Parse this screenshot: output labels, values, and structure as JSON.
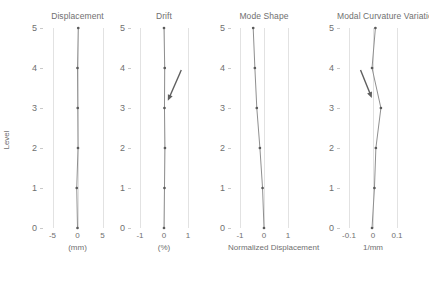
{
  "figure": {
    "ylabel": "Level",
    "y_ticks": [
      "5",
      "4",
      "3",
      "2",
      "1",
      "0"
    ]
  },
  "chart_data": {
    "type": "line",
    "title": "",
    "ylabel": "Level",
    "ylim": [
      0,
      5
    ],
    "y_ticks": [
      5,
      4,
      3,
      2,
      1,
      0
    ],
    "grid": true,
    "legend": "none",
    "orientation": "vertical-profile",
    "panels": [
      {
        "title": "Displacement",
        "xlabel": "(mm)",
        "xlim": [
          -7.5,
          7.5
        ],
        "x_ticks": [
          -5,
          0,
          5
        ],
        "x_tick_labels": [
          "-5",
          "0",
          "5"
        ],
        "series": [
          {
            "name": "Displacement",
            "y": [
              0,
              1,
              2,
              3,
              4,
              5
            ],
            "values": [
              0.0,
              -0.15,
              0.1,
              0.05,
              0.0,
              0.15
            ]
          }
        ],
        "annotations": []
      },
      {
        "title": "Drift",
        "xlabel": "(%)",
        "xlim": [
          -1.5,
          1.5
        ],
        "x_ticks": [
          -1,
          0,
          1
        ],
        "x_tick_labels": [
          "-1",
          "0",
          "1"
        ],
        "series": [
          {
            "name": "Drift",
            "y": [
              0,
              1,
              2,
              3,
              4,
              5
            ],
            "values": [
              0.0,
              0.02,
              0.04,
              0.02,
              0.03,
              0.0
            ]
          }
        ],
        "annotations": [
          {
            "type": "arrow",
            "label": "",
            "from": [
              0.72,
              3.95
            ],
            "to": [
              0.16,
              3.18
            ]
          }
        ]
      },
      {
        "title": "Mode Shape",
        "xlabel": "Normalized Displacement",
        "xlim": [
          -1.5,
          1.5
        ],
        "x_ticks": [
          -1,
          0,
          1
        ],
        "x_tick_labels": [
          "-1",
          "0",
          "1"
        ],
        "series": [
          {
            "name": "Mode Shape",
            "y": [
              0,
              1,
              2,
              3,
              4,
              5
            ],
            "values": [
              0.0,
              -0.06,
              -0.17,
              -0.3,
              -0.38,
              -0.45
            ]
          }
        ],
        "annotations": []
      },
      {
        "title": "Modal Curvature Variation",
        "xlabel": "1/mm",
        "xlim": [
          -0.15,
          0.15
        ],
        "x_ticks": [
          -0.1,
          0,
          0.1
        ],
        "x_tick_labels": [
          "-0.1",
          "0",
          "0.1"
        ],
        "series": [
          {
            "name": "Modal Curvature Variation",
            "y": [
              0,
              1,
              2,
              3,
              4,
              5
            ],
            "values": [
              -0.004,
              0.006,
              0.012,
              0.033,
              -0.004,
              0.01
            ]
          }
        ],
        "annotations": [
          {
            "type": "arrow",
            "label": "",
            "from": [
              -0.052,
              3.95
            ],
            "to": [
              -0.005,
              3.25
            ]
          }
        ]
      }
    ]
  }
}
